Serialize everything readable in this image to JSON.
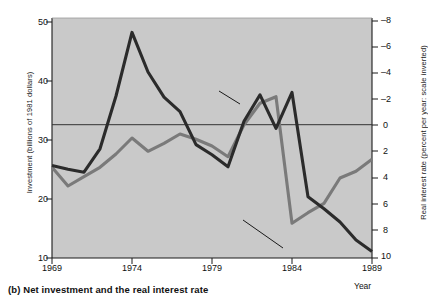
{
  "caption": "(b) Net investment and the real interest rate",
  "axes": {
    "left_title": "Investment (billions of 1981 dollars)",
    "right_title": "Real interest rate (percent per year: scale inverted)",
    "x_title": "Year"
  },
  "annotations": {
    "net_investment": "Net investment",
    "real_interest_rate": "Real intrest rate"
  },
  "ticks": {
    "left": [
      "50",
      "40",
      "30",
      "20",
      "10"
    ],
    "right": [
      "–8",
      "–6",
      "–4",
      "–2",
      "0",
      "2",
      "4",
      "6",
      "8",
      "10"
    ],
    "x": [
      "1969",
      "1974",
      "1979",
      "1984",
      "1989"
    ]
  },
  "colors": {
    "panel": "#c9c9c9",
    "net_investment_line": "#2b2b2b",
    "real_interest_line": "#7a7a7a",
    "zero_line": "#333333",
    "axis": "#1a1a1a",
    "text": "#111111"
  },
  "chart_data": {
    "type": "line",
    "title": "(b) Net investment and the real interest rate",
    "xlabel": "Year",
    "ylabel": "Investment (billions of 1981 dollars)",
    "y2label": "Real interest rate (percent per year: scale inverted)",
    "x": [
      1969,
      1970,
      1971,
      1972,
      1973,
      1974,
      1975,
      1976,
      1977,
      1978,
      1979,
      1980,
      1981,
      1982,
      1983,
      1984,
      1985,
      1986,
      1987,
      1988,
      1989
    ],
    "xlim": [
      1969,
      1989
    ],
    "ylim": [
      10,
      50
    ],
    "y2lim": [
      -8,
      10
    ],
    "y2_inverted": true,
    "grid": false,
    "legend": "annotated-inline",
    "zero_reference_line": {
      "value": 0,
      "axis": "right"
    },
    "series": [
      {
        "name": "Net investment",
        "axis": "left",
        "color": "#2b2b2b",
        "units": "billions of 1981 dollars",
        "values": [
          25.4,
          24.8,
          24.3,
          28.2,
          37.0,
          47.6,
          41.0,
          36.8,
          34.4,
          28.9,
          27.2,
          25.2,
          32.8,
          37.2,
          31.6,
          37.6,
          20.2,
          18.2,
          16.0,
          13.0,
          11.1
        ],
        "note": "Values after 1984 continue: 1985 13.4, 1986 16.3, 1987 20.4, 1988 18.9, 1989 21.7"
      },
      {
        "name": "Real intrest rate",
        "axis": "right",
        "color": "#7a7a7a",
        "units": "percent per year",
        "values": [
          3.2,
          4.6,
          3.9,
          3.2,
          2.2,
          1.0,
          2.0,
          1.4,
          0.7,
          1.1,
          1.6,
          2.4,
          0.0,
          -1.6,
          -2.1,
          7.4,
          6.6,
          5.9,
          4.0,
          3.5,
          2.6
        ],
        "note": "Plotted on inverted right axis; 1979 crosses zero, deep negative 1981-1983, sharp rise after 1984"
      }
    ]
  },
  "geometry": {
    "plot": {
      "x": 52,
      "y": 18,
      "w": 320,
      "h": 240
    },
    "net_investment_points": "52,167 68,171 84,174 100,151 117,99 140,35 156,74 172,94 188,137 204,160 220,168 236,125 252,85 268,132 284,82 300,218 316,236 332,254 348,245 363,238 372,31",
    "real_interest_points": "52,196 68,219 84,208 100,190 116,172 140,143 156,157 172,144 188,136 204,148 220,155 236,126 252,104 268,99 284,183 300,172 316,160 332,152 348,120 363,62 372,36"
  }
}
